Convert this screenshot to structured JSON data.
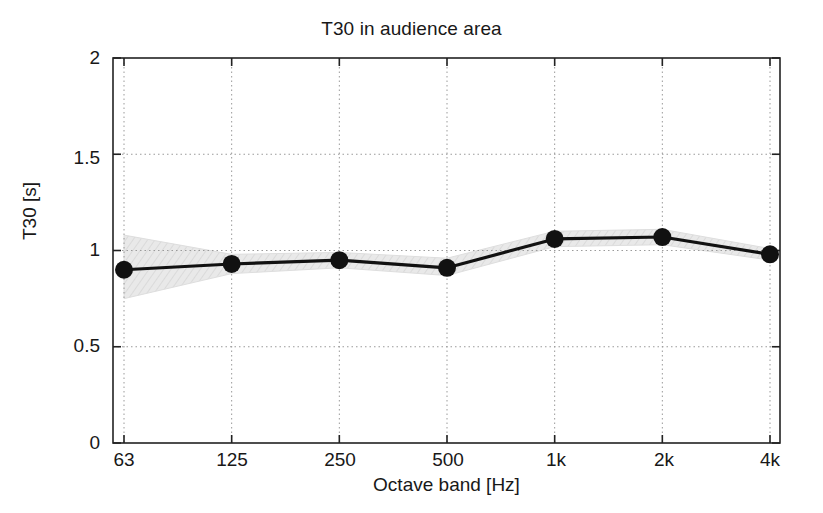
{
  "chart_data": {
    "type": "line",
    "title": "T30 in audience area",
    "xlabel": "Octave band [Hz]",
    "ylabel": "T30 [s]",
    "categories": [
      "63",
      "125",
      "250",
      "500",
      "1k",
      "2k",
      "4k"
    ],
    "values": [
      0.9,
      0.93,
      0.95,
      0.91,
      1.06,
      1.07,
      0.98
    ],
    "band_upper": [
      1.08,
      0.98,
      0.99,
      0.96,
      1.1,
      1.11,
      1.01
    ],
    "band_lower": [
      0.75,
      0.88,
      0.91,
      0.87,
      1.02,
      1.03,
      0.95
    ],
    "series": [
      {
        "name": "T30",
        "values": [
          0.9,
          0.93,
          0.95,
          0.91,
          1.06,
          1.07,
          0.98
        ]
      }
    ],
    "ylim": [
      0,
      2
    ],
    "yticks": [
      "0",
      "0.5",
      "1",
      "1.5",
      "2"
    ],
    "ytick_values": [
      0,
      0.5,
      1,
      1.5,
      2
    ],
    "xtick_labels": [
      "63",
      "125",
      "250",
      "500",
      "1k",
      "2k",
      "4k"
    ],
    "grid": true,
    "grid_style": "dotted",
    "legend": "none",
    "marker": "filled-circle",
    "line_color": "#111111",
    "band_color": "#e6e6e6",
    "background_color": "#ffffff"
  },
  "axes": {
    "y_tick_labels": [
      "2",
      "1.5",
      "1",
      "0.5",
      "0"
    ],
    "x_tick_labels": [
      "63",
      "125",
      "250",
      "500",
      "1k",
      "2k",
      "4k"
    ]
  }
}
